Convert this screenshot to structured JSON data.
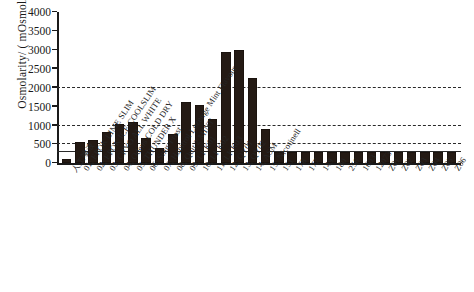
{
  "chart_data": {
    "type": "bar",
    "title": "",
    "xlabel": "",
    "ylabel": "Osmolarity/ ( mOsmol/L )",
    "ylim": [
      0,
      4000
    ],
    "ytick_values": [
      0,
      500,
      1000,
      1500,
      2000,
      2500,
      3000,
      3500,
      4000
    ],
    "ytick_labels": [
      "0",
      "500",
      "1000",
      "1500",
      "2000",
      "2500",
      "3000",
      "3500",
      "4000"
    ],
    "grid": true,
    "gridlines": [
      {
        "value": 2000,
        "style": "dashed"
      },
      {
        "value": 1000,
        "style": "dashed"
      },
      {
        "value": 500,
        "style": "dashed"
      },
      {
        "value": 300,
        "style": "solid"
      }
    ],
    "legend": "none",
    "bar_color": "#241a14",
    "categories": [
      "人工唾液",
      "01; EPOK LIME SLIM",
      "02; EPOK ICE COOLSLIM",
      "03; CRYO ALL WHITE",
      "04; Odens COLD DRY",
      "05; THUNDER X",
      "06; Snus Frost",
      "07; Habitrol Lozenge Mint Flavour",
      "08; Quit 2 MINT",
      "09; LKK01",
      "10; LKK02",
      "11; LKK03",
      "12; QY01",
      "13; QY02",
      "14; ASM",
      "15; Nicotinell",
      "151",
      "178",
      "177",
      "149",
      "180",
      "256",
      "1603",
      "12073",
      "Z01",
      "Z02",
      "Z03",
      "Z04",
      "Z05",
      "Z06"
    ],
    "values": [
      110,
      560,
      620,
      820,
      1050,
      1100,
      680,
      400,
      780,
      1620,
      1540,
      1180,
      2950,
      3000,
      2260,
      900,
      300,
      300,
      300,
      300,
      300,
      300,
      300,
      300,
      300,
      300,
      300,
      300,
      300,
      300
    ]
  }
}
